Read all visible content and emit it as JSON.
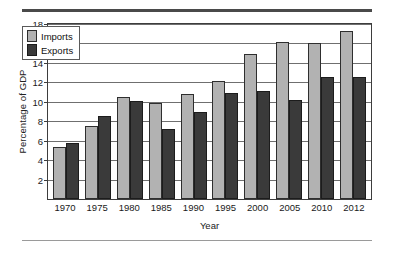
{
  "chart_data": {
    "type": "bar",
    "title": "",
    "subtitle": "",
    "xlabel": "Year",
    "ylabel": "Percentage of GDP",
    "categories": [
      "1970",
      "1975",
      "1980",
      "1985",
      "1990",
      "1995",
      "2000",
      "2005",
      "2010",
      "2012"
    ],
    "series": [
      {
        "name": "Imports",
        "color": "#b2b2b2",
        "values": [
          5.4,
          7.5,
          10.5,
          9.9,
          10.8,
          12.1,
          14.9,
          16.1,
          16.0,
          17.3
        ]
      },
      {
        "name": "Exports",
        "color": "#3a3a3a",
        "values": [
          5.8,
          8.5,
          10.1,
          7.2,
          8.9,
          10.9,
          11.1,
          10.2,
          12.5,
          12.6
        ]
      }
    ],
    "ylim": [
      0,
      18
    ],
    "yticks": [
      2,
      4,
      6,
      8,
      10,
      12,
      14,
      16,
      18
    ],
    "ytick_labels": [
      "2",
      "4",
      "6",
      "8",
      "10",
      "12",
      "14",
      "16",
      "18"
    ],
    "grid": true,
    "legend_position": "top-left",
    "legend_entries": [
      "Imports",
      "Exports"
    ]
  }
}
